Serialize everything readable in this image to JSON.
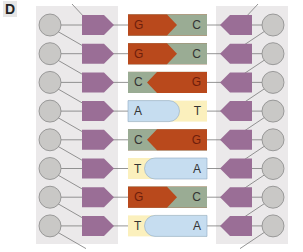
{
  "panel_label": "D",
  "colors": {
    "backbone_panel": "#ebe9ea",
    "sugar_circle": "#c9c8c6",
    "sugar_stroke": "#8a8a8a",
    "phosphate_pentagon": "#9a6e96",
    "line": "#7a7a7a",
    "G": "#b9491c",
    "C": "#9aac94",
    "A": "#c6ddf0",
    "T": "#fbf0bd",
    "label_dark": "#6e1e0c",
    "label_neutral": "#333333"
  },
  "base_pairs": [
    {
      "left": "G",
      "right": "C"
    },
    {
      "left": "G",
      "right": "C"
    },
    {
      "left": "C",
      "right": "G"
    },
    {
      "left": "A",
      "right": "T"
    },
    {
      "left": "C",
      "right": "G"
    },
    {
      "left": "T",
      "right": "A"
    },
    {
      "left": "G",
      "right": "C"
    },
    {
      "left": "T",
      "right": "A"
    }
  ]
}
